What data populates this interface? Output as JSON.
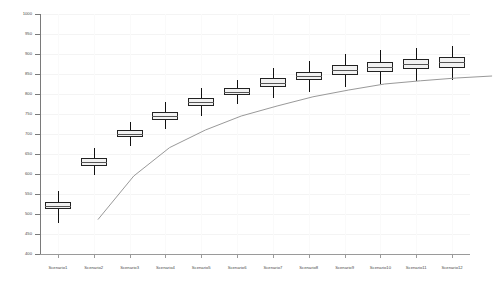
{
  "chart_data": {
    "type": "box",
    "title": "",
    "xlabel": "",
    "ylabel": "",
    "ylim": [
      400,
      1000
    ],
    "ytick_step": 50,
    "yticks": [
      400,
      450,
      500,
      550,
      600,
      650,
      700,
      750,
      800,
      850,
      900,
      950,
      1000
    ],
    "ytick_labels": [
      "400",
      "450",
      "500",
      "550",
      "600",
      "650",
      "700",
      "750",
      "800",
      "850",
      "900",
      "950",
      "1000"
    ],
    "grid": true,
    "legend": null,
    "categories": [
      "Scenario1",
      "Scenario2",
      "Scenario3",
      "Scenario4",
      "Scenario5",
      "Scenario6",
      "Scenario7",
      "Scenario8",
      "Scenario9",
      "Scenario10",
      "Scenario11",
      "Scenario12"
    ],
    "boxes": [
      {
        "category": "Scenario1",
        "whisker_low": 478,
        "q1": 512,
        "median": 521,
        "q3": 530,
        "whisker_high": 557
      },
      {
        "category": "Scenario2",
        "whisker_low": 597,
        "q1": 621,
        "median": 630,
        "q3": 640,
        "whisker_high": 664
      },
      {
        "category": "Scenario3",
        "whisker_low": 671,
        "q1": 693,
        "median": 701,
        "q3": 710,
        "whisker_high": 731
      },
      {
        "category": "Scenario4",
        "whisker_low": 712,
        "q1": 736,
        "median": 745,
        "q3": 755,
        "whisker_high": 779
      },
      {
        "category": "Scenario5",
        "whisker_low": 745,
        "q1": 770,
        "median": 780,
        "q3": 791,
        "whisker_high": 815
      },
      {
        "category": "Scenario6",
        "whisker_low": 775,
        "q1": 797,
        "median": 805,
        "q3": 814,
        "whisker_high": 836
      },
      {
        "category": "Scenario7",
        "whisker_low": 790,
        "q1": 818,
        "median": 828,
        "q3": 839,
        "whisker_high": 866
      },
      {
        "category": "Scenario8",
        "whisker_low": 806,
        "q1": 834,
        "median": 845,
        "q3": 856,
        "whisker_high": 883
      },
      {
        "category": "Scenario9",
        "whisker_low": 818,
        "q1": 848,
        "median": 860,
        "q3": 872,
        "whisker_high": 901
      },
      {
        "category": "Scenario10",
        "whisker_low": 826,
        "q1": 856,
        "median": 868,
        "q3": 880,
        "whisker_high": 909
      },
      {
        "category": "Scenario11",
        "whisker_low": 832,
        "q1": 862,
        "median": 875,
        "q3": 887,
        "whisker_high": 916
      },
      {
        "category": "Scenario12",
        "whisker_low": 836,
        "q1": 866,
        "median": 880,
        "q3": 893,
        "whisker_high": 921
      }
    ],
    "trend_line": {
      "name": "median-trend",
      "values": [
        521,
        630,
        701,
        745,
        780,
        805,
        828,
        845,
        860,
        868,
        875,
        880
      ]
    }
  },
  "style": {
    "box_fill": "#f2f2f2",
    "box_edge": "#222222",
    "median_color": "#555555",
    "whisker_color": "#111111",
    "trend_color": "#999999",
    "axis_color": "#7a7a7a",
    "grid_color": "#f4f4f4",
    "background": "#ffffff"
  }
}
